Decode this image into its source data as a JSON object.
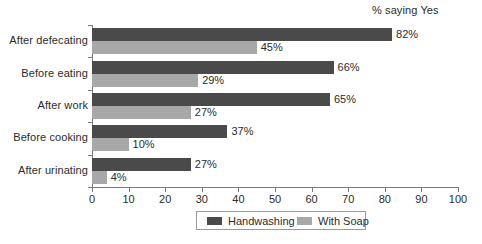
{
  "chart_data": {
    "type": "bar",
    "orientation": "horizontal",
    "title": "% saying Yes",
    "xlabel": "",
    "ylabel": "",
    "xlim": [
      0,
      100
    ],
    "xticks": [
      0,
      10,
      20,
      30,
      40,
      50,
      60,
      70,
      80,
      90,
      100
    ],
    "grid": false,
    "legend_position": "bottom",
    "categories": [
      "After defecating",
      "Before eating",
      "After work",
      "Before cooking",
      "After urinating"
    ],
    "series": [
      {
        "name": "Handwashing",
        "color": "#4a4a4a",
        "values": [
          82,
          66,
          65,
          37,
          27
        ],
        "labels": [
          "82%",
          "66%",
          "65%",
          "37%",
          "27%"
        ]
      },
      {
        "name": "With Soap",
        "color": "#a8a8a8",
        "values": [
          45,
          29,
          27,
          10,
          4
        ],
        "labels": [
          "45%",
          "29%",
          "27%",
          "10%",
          "4%"
        ]
      }
    ]
  },
  "axis": {
    "tick_labels": [
      "0",
      "10",
      "20",
      "30",
      "40",
      "50",
      "60",
      "70",
      "80",
      "90",
      "100"
    ]
  },
  "legend": {
    "items": [
      {
        "label": "Handwashing",
        "swatch": "dark"
      },
      {
        "label": "With Soap",
        "swatch": "light"
      }
    ]
  }
}
